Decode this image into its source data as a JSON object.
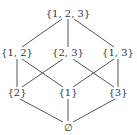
{
  "diagram": {
    "nodes": [
      {
        "id": "n123",
        "label": "{1, 2, 3}",
        "x": 68,
        "y": 14
      },
      {
        "id": "n12",
        "label": "{1, 2}",
        "x": 17,
        "y": 53
      },
      {
        "id": "n23",
        "label": "{2, 3}",
        "x": 68,
        "y": 53
      },
      {
        "id": "n13",
        "label": "{1, 3}",
        "x": 118,
        "y": 53
      },
      {
        "id": "n2",
        "label": "{2}",
        "x": 17,
        "y": 93
      },
      {
        "id": "n1",
        "label": "{1}",
        "x": 68,
        "y": 93
      },
      {
        "id": "n3",
        "label": "{3}",
        "x": 118,
        "y": 93
      },
      {
        "id": "n0",
        "label": "∅",
        "x": 68,
        "y": 127
      }
    ],
    "edges": [
      [
        "n123",
        "n12"
      ],
      [
        "n123",
        "n23"
      ],
      [
        "n123",
        "n13"
      ],
      [
        "n12",
        "n2"
      ],
      [
        "n12",
        "n1"
      ],
      [
        "n23",
        "n2"
      ],
      [
        "n23",
        "n3"
      ],
      [
        "n13",
        "n1"
      ],
      [
        "n13",
        "n3"
      ],
      [
        "n2",
        "n0"
      ],
      [
        "n1",
        "n0"
      ],
      [
        "n3",
        "n0"
      ]
    ]
  }
}
